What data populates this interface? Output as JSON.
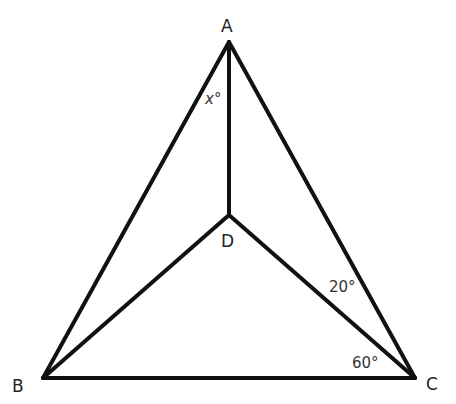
{
  "diagram": {
    "type": "geometry",
    "points": {
      "A": {
        "label": "A",
        "x": 229,
        "y": 42
      },
      "B": {
        "label": "B",
        "x": 43,
        "y": 378
      },
      "C": {
        "label": "C",
        "x": 415,
        "y": 378
      },
      "D": {
        "label": "D",
        "x": 229,
        "y": 215
      }
    },
    "segments": [
      "AB",
      "AC",
      "BC",
      "AD",
      "BD",
      "CD"
    ],
    "angles": {
      "x": {
        "text": "x°",
        "at": "A",
        "between": "AB-AD"
      },
      "dcA": {
        "text": "20°",
        "at": "C",
        "between": "CD-CA"
      },
      "bcD": {
        "text": "60°",
        "at": "C",
        "between": "CB-CD"
      }
    },
    "colors": {
      "stroke": "#111111",
      "text": "#222222",
      "background": "#ffffff"
    }
  }
}
